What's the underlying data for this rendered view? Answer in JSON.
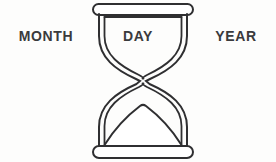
{
  "illustration": {
    "name": "hourglass",
    "alt_text": "Hourglass line drawing",
    "line_color": "#2f2f31",
    "fill_color": "#ffffff",
    "background_color": "#fdfdfc",
    "stroke_width": "2"
  },
  "labels": {
    "month": "MONTH",
    "day": "DAY",
    "year": "YEAR",
    "text_color": "#3a3a3c"
  },
  "parts": {
    "top_cap": "top-cap",
    "top_bulb": "top-bulb",
    "neck": "neck",
    "bottom_bulb": "bottom-bulb",
    "sand_mound": "sand-mound",
    "bottom_cap": "bottom-cap"
  }
}
